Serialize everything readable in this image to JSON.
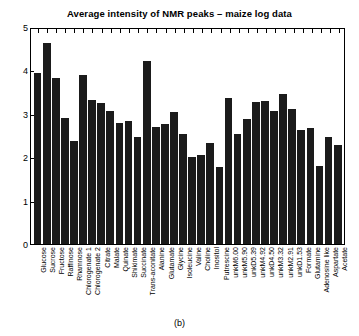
{
  "chart_data": {
    "type": "bar",
    "title": "Average intensity of NMR peaks – maize log data",
    "xlabel": "",
    "ylabel": "",
    "ylim": [
      0,
      5
    ],
    "yticks": [
      0,
      1,
      2,
      3,
      4,
      5
    ],
    "grid": false,
    "legend": null,
    "bar_color": "#1b1b1b",
    "categories": [
      "Glucose",
      "Sucrose",
      "Fructose",
      "Raffinose",
      "Rhamnose",
      "Chlorogenate 1",
      "Chlorogenate 2",
      "Citrate",
      "Malate",
      "Quinate",
      "Shikimate",
      "Succinate",
      "Trans-aconitate",
      "Alanine",
      "Glutamate",
      "Glycine",
      "Isoleucine",
      "Valine",
      "Choline",
      "Inositol",
      "Putrescine",
      "unkM6.00",
      "unkM5.90",
      "unkD5.39",
      "unkM4.92",
      "unkD4.50",
      "unkM3.32",
      "unkM2.91",
      "unkD1.53",
      "Formate",
      "Glutamine",
      "Adenosine like",
      "Aspartate",
      "Acetate"
    ],
    "values": [
      3.98,
      4.67,
      3.85,
      2.93,
      2.4,
      3.92,
      3.35,
      3.27,
      3.1,
      2.82,
      2.87,
      2.5,
      4.25,
      2.72,
      2.78,
      3.08,
      2.55,
      2.02,
      2.08,
      2.35,
      1.78,
      3.4,
      2.55,
      2.9,
      3.3,
      3.32,
      3.1,
      3.5,
      3.13,
      2.66,
      2.7,
      1.82,
      2.5,
      2.3
    ]
  },
  "caption": "(b)"
}
